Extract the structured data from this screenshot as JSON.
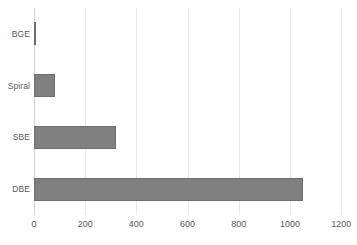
{
  "chart_data": {
    "type": "bar",
    "orientation": "horizontal",
    "title": "",
    "xlabel": "",
    "ylabel": "",
    "categories": [
      "DBE",
      "SBE",
      "Spiral",
      "BGE"
    ],
    "values": [
      1050,
      320,
      82,
      8
    ],
    "series": [
      {
        "name": "",
        "values": [
          1050,
          320,
          82,
          8
        ]
      }
    ],
    "xlim": [
      0,
      1258
    ],
    "xticks": [
      0,
      200,
      400,
      600,
      800,
      1000,
      1200
    ],
    "xtick_labels": [
      "0",
      "200",
      "400",
      "600",
      "800",
      "1000",
      "1200"
    ],
    "ytick_labels": [
      "DBE",
      "SBE",
      "Spiral",
      "BGE"
    ],
    "grid": "vertical",
    "legend": "none",
    "bar_color": "#808080",
    "bar_border_color": "#6e6e6e",
    "gridline_color": "#e8e8e8",
    "axis_color": "#d0d0d0",
    "text_color": "#595959",
    "background": "#ffffff"
  }
}
